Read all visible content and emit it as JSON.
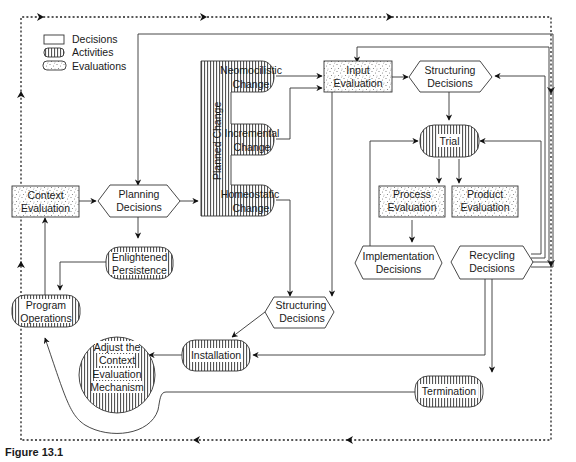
{
  "legend": {
    "decisions": "Decisions",
    "activities": "Activities",
    "evaluations": "Evaluations"
  },
  "nodes": {
    "context_evaluation": [
      "Context",
      "Evaluation"
    ],
    "planning_decisions": [
      "Planning",
      "Decisions"
    ],
    "planned_change": "Planned Change",
    "neomocilistic_change": [
      "Neomocilistic",
      "Change"
    ],
    "incremental_change": [
      "Incremental",
      "Change"
    ],
    "homeostatic_change": [
      "Homeostatic",
      "Change"
    ],
    "input_evaluation": [
      "Input",
      "Evaluation"
    ],
    "structuring_decisions_top": [
      "Structuring",
      "Decisions"
    ],
    "trial": "Trial",
    "process_evaluation": [
      "Process",
      "Evaluation"
    ],
    "product_evaluation": [
      "Product",
      "Evaluation"
    ],
    "implementation_decisions": [
      "Implementation",
      "Decisions"
    ],
    "recycling_decisions": [
      "Recycling",
      "Decisions"
    ],
    "enlightened_persistence": [
      "Enlightened",
      "Persistence"
    ],
    "program_operations": [
      "Program",
      "Operations"
    ],
    "structuring_decisions_bottom": [
      "Structuring",
      "Decisions"
    ],
    "installation": "Installation",
    "adjust_mechanism": [
      "Adjust the",
      "Context",
      "Evaluation",
      "Mechanism"
    ],
    "termination": "Termination"
  },
  "caption": "Figure 13.1",
  "colors": {
    "stroke": "#333333",
    "fill": "#ffffff",
    "pattern": "#555555"
  }
}
